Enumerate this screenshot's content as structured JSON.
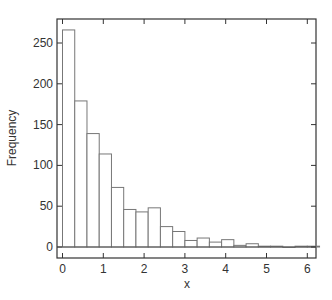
{
  "chart_data": {
    "type": "bar",
    "subtype": "histogram",
    "title": "",
    "xlabel": "x",
    "ylabel": "Frequency",
    "bin_width": 0.3,
    "bin_edges": [
      0,
      0.3,
      0.6,
      0.9,
      1.2,
      1.5,
      1.8,
      2.1,
      2.4,
      2.7,
      3.0,
      3.3,
      3.6,
      3.9,
      4.2,
      4.5,
      4.8,
      5.1,
      5.4,
      5.7,
      6.0,
      6.3
    ],
    "values": [
      266,
      179,
      139,
      114,
      73,
      46,
      43,
      48,
      25,
      19,
      8,
      11,
      6,
      9,
      2,
      4,
      1,
      1,
      0,
      1,
      1
    ],
    "xlim": [
      -0.15,
      6.3
    ],
    "ylim": [
      -13,
      280
    ],
    "xticks": [
      0,
      1,
      2,
      3,
      4,
      5,
      6
    ],
    "xtick_labels": [
      "0",
      "1",
      "2",
      "3",
      "4",
      "5",
      "6"
    ],
    "yticks": [
      0,
      50,
      100,
      150,
      200,
      250
    ],
    "ytick_labels": [
      "0",
      "50",
      "100",
      "150",
      "200",
      "250"
    ],
    "grid": false,
    "legend": null,
    "bar_fill": "#ffffff",
    "bar_stroke": "#777777",
    "frame_color": "#333333"
  }
}
